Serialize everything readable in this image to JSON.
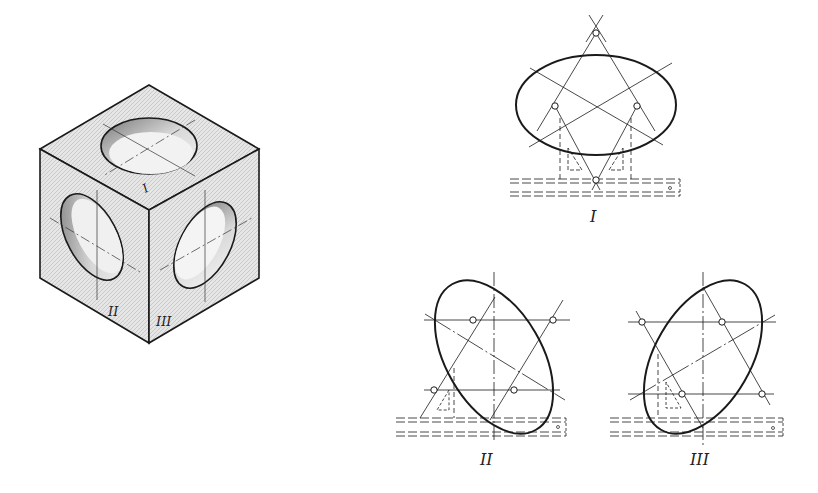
{
  "figure": {
    "cube": {
      "face_labels": {
        "top": "I",
        "left": "II",
        "right": "III"
      }
    },
    "constructions": [
      {
        "id": "I",
        "label": "I",
        "orientation": "horizontal ellipse"
      },
      {
        "id": "II",
        "label": "II",
        "orientation": "ellipse tilted left"
      },
      {
        "id": "III",
        "label": "III",
        "orientation": "ellipse tilted right"
      }
    ]
  },
  "colors": {
    "line": "#1a1a1a",
    "shade": "#9a9a9a",
    "paper": "#ffffff"
  }
}
